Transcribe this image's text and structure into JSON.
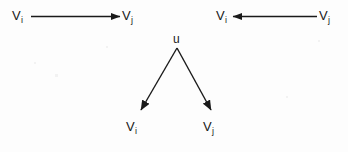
{
  "figure": {
    "background_color": "#fdfdfd",
    "stroke_color": "#1a1a1a",
    "diagrams": [
      {
        "id": "edge-i-to-j",
        "type": "directed-edge",
        "direction": "right",
        "source_label": {
          "base": "V",
          "sub": "i"
        },
        "target_label": {
          "base": "V",
          "sub": "j"
        }
      },
      {
        "id": "edge-j-to-i",
        "type": "directed-edge",
        "direction": "left",
        "source_label": {
          "base": "V",
          "sub": "j"
        },
        "target_label": {
          "base": "V",
          "sub": "i"
        }
      },
      {
        "id": "common-parent-u",
        "type": "branching-edges",
        "parent_label": {
          "base": "u",
          "sub": ""
        },
        "left_child_label": {
          "base": "V",
          "sub": "i"
        },
        "right_child_label": {
          "base": "V",
          "sub": "j"
        }
      }
    ],
    "labels": {
      "top_left_source": {
        "base": "V",
        "sub": "i"
      },
      "top_left_target": {
        "base": "V",
        "sub": "j"
      },
      "top_right_target": {
        "base": "V",
        "sub": "i"
      },
      "top_right_source": {
        "base": "V",
        "sub": "j"
      },
      "parent": {
        "base": "u",
        "sub": ""
      },
      "bottom_left_child": {
        "base": "V",
        "sub": "i"
      },
      "bottom_right_child": {
        "base": "V",
        "sub": "j"
      }
    }
  }
}
